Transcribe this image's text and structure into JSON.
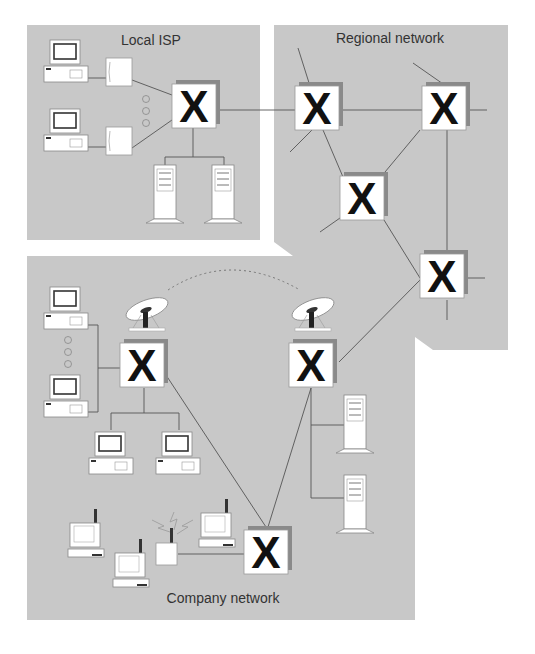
{
  "regions": {
    "local_isp": {
      "label": "Local ISP"
    },
    "regional": {
      "label": "Regional network"
    },
    "company": {
      "label": "Company network"
    }
  },
  "router_glyph": "X",
  "colors": {
    "region_fill": "#c8c8c8",
    "router_face": "#ffffff",
    "router_shadow": "#8a8a8a",
    "line": "#555555",
    "text": "#333333"
  }
}
